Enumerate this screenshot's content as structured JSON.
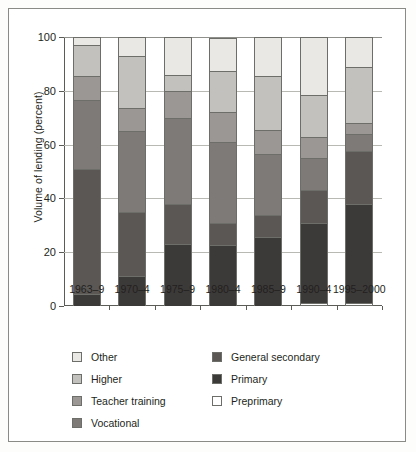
{
  "figure": {
    "ylabel": "Volume of lending (percent)"
  },
  "chart_data": {
    "type": "bar",
    "title": "",
    "xlabel": "",
    "ylabel": "Volume of lending (percent)",
    "ylim": [
      0,
      100
    ],
    "yticks": [
      0,
      20,
      40,
      60,
      80,
      100
    ],
    "ytick_labels": [
      "0",
      "20",
      "40",
      "60",
      "80",
      "100"
    ],
    "grid": true,
    "stacked": true,
    "legend_position": "below-axes",
    "categories": [
      "1963–9",
      "1970–4",
      "1975–9",
      "1980–4",
      "1985–9",
      "1990–4",
      "1995–2000"
    ],
    "series": [
      {
        "name": "Preprimary",
        "color": "#ffffff",
        "values": [
          0,
          0,
          0,
          0,
          0,
          1.3,
          1.0
        ]
      },
      {
        "name": "Primary",
        "color": "#3c3a38",
        "values": [
          4.5,
          11.0,
          23.0,
          22.5,
          25.5,
          29.7,
          37.0
        ]
      },
      {
        "name": "General secondary",
        "color": "#5a5754",
        "values": [
          46.5,
          24.0,
          15.0,
          8.5,
          8.5,
          12.0,
          19.5
        ]
      },
      {
        "name": "Vocational",
        "color": "#7d7a77",
        "values": [
          25.5,
          30.0,
          32.0,
          30.0,
          22.5,
          12.0,
          6.5
        ]
      },
      {
        "name": "Teacher training",
        "color": "#9a9794",
        "values": [
          9.0,
          8.5,
          10.0,
          11.0,
          9.0,
          8.0,
          4.0
        ]
      },
      {
        "name": "Higher",
        "color": "#c3c1bd",
        "values": [
          11.5,
          19.5,
          6.0,
          15.5,
          20.0,
          15.5,
          21.0
        ]
      },
      {
        "name": "Other",
        "color": "#e9e8e4",
        "values": [
          3.0,
          7.0,
          14.0,
          12.0,
          14.5,
          21.5,
          11.0
        ]
      }
    ],
    "stack_order_bottom_to_top": [
      "Preprimary",
      "Primary",
      "General secondary",
      "Vocational",
      "Teacher training",
      "Higher",
      "Other"
    ]
  },
  "legend": {
    "left_column": [
      {
        "label": "Other",
        "color": "#e9e8e4"
      },
      {
        "label": "Higher",
        "color": "#c3c1bd"
      },
      {
        "label": "Teacher training",
        "color": "#9a9794"
      },
      {
        "label": "Vocational",
        "color": "#7d7a77"
      }
    ],
    "right_column": [
      {
        "label": "General secondary",
        "color": "#5a5754"
      },
      {
        "label": "Primary",
        "color": "#3c3a38"
      },
      {
        "label": "Preprimary",
        "color": "#ffffff"
      }
    ]
  }
}
